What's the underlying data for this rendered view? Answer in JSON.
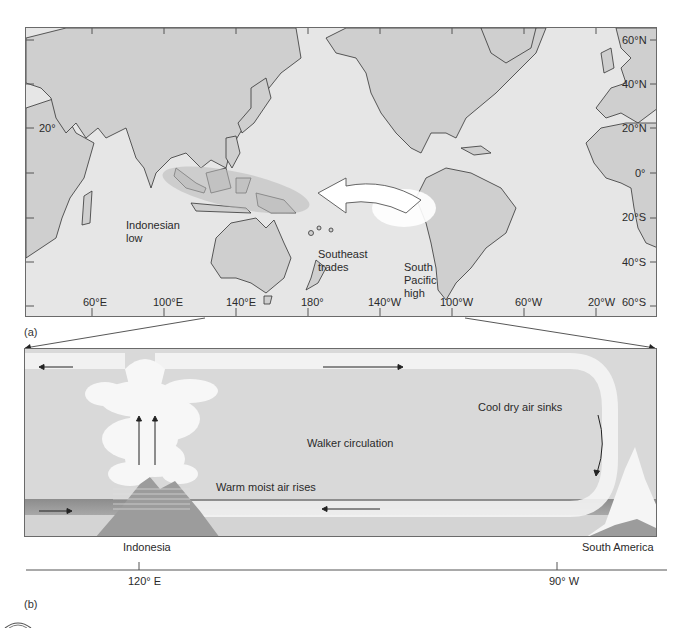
{
  "figure": {
    "panel_a": {
      "label": "(a)",
      "longitude_ticks": [
        "60°E",
        "100°E",
        "140°E",
        "180°",
        "140°W",
        "100°W",
        "60°W",
        "20°W"
      ],
      "latitude_ticks": [
        "60°N",
        "40°N",
        "20°N",
        "0°",
        "20°S",
        "40°S",
        "60°S"
      ],
      "left_lat_label": "20°",
      "annotations": {
        "indonesian_low_line1": "Indonesian",
        "indonesian_low_line2": "low",
        "southeast_trades_line1": "Southeast",
        "southeast_trades_line2": "trades",
        "south_pacific_high_line1": "South",
        "south_pacific_high_line2": "Pacific",
        "south_pacific_high_line3": "high"
      }
    },
    "panel_b": {
      "label": "(b)",
      "title": "Walker circulation",
      "rising_label": "Warm moist air rises",
      "sinking_label": "Cool dry air sinks",
      "left_place": "Indonesia",
      "right_place": "South America",
      "axis_ticks": [
        "120°  E",
        "90°  W"
      ]
    },
    "colors": {
      "ocean": "#e6e6e6",
      "land": "#cfcfcf",
      "panel_bg": "#d9d9d9",
      "loop": "#f2f2f2",
      "surface_band": "#9a9a9a",
      "border": "#6a6a6a"
    }
  }
}
